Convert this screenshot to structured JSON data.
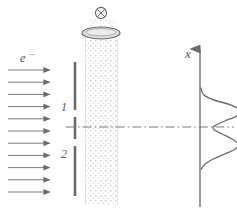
{
  "figure": {
    "background_color": "#ffffff",
    "ink_color": "#6b6b6b",
    "dark_ink_color": "#555555",
    "stipple_color": "#cfcfcf",
    "lens_fill_color": "#dcdcdc",
    "width": 237,
    "height": 213
  },
  "labels": {
    "electron_beam": "e",
    "electron_charge_superscript": "–",
    "slit_top": "1",
    "slit_bottom": "2",
    "axis_x": "x"
  },
  "source": {
    "symbol_name": "circle-cross-into-page",
    "symbol_glyph": "⊗",
    "center_x": 101,
    "center_y": 13,
    "radius": 6
  },
  "lens": {
    "name": "condenser-lens-ellipse",
    "center_x": 101,
    "center_y": 33,
    "rx": 19,
    "ry": 6,
    "fill": "#dcdcdc"
  },
  "beam": {
    "name": "stippled-photon-beam",
    "left_x": 85,
    "right_x": 118,
    "top_y": 39,
    "bottom_y": 205,
    "dot_color": "#cfcfcf"
  },
  "electron_arrows": {
    "count": 11,
    "start_x": 8,
    "end_x": 50,
    "first_y": 70,
    "spacing": 12.2,
    "label_x": 20,
    "label_y": 62
  },
  "barrier": {
    "name": "double-slit-barrier",
    "x": 75,
    "segments": [
      {
        "name": "upper-plate",
        "y_top": 62,
        "y_bottom": 110
      },
      {
        "name": "center-plate",
        "y_top": 117,
        "y_bottom": 139
      },
      {
        "name": "lower-plate",
        "y_top": 146,
        "y_bottom": 196
      }
    ],
    "slit_labels": [
      {
        "text": "1",
        "x": 64,
        "y": 110
      },
      {
        "text": "2",
        "x": 64,
        "y": 156
      }
    ]
  },
  "optical_axis": {
    "name": "dash-dot-optical-axis",
    "y": 127,
    "x_start": 76,
    "x_end": 234,
    "style": "dash-dot"
  },
  "detector_axis": {
    "name": "x-axis-vertical",
    "x": 200,
    "y_top": 40,
    "y_bottom": 207,
    "arrow_tip_y": 38,
    "label": "x",
    "label_x": 188,
    "label_y": 54
  },
  "chart_data": {
    "type": "line",
    "orientation": "vertical",
    "xlabel": "intensity",
    "ylabel": "x",
    "grid": false,
    "legend": null,
    "axis_x_pixel": 200,
    "center_y": 127,
    "points": [
      {
        "x_position": 88,
        "intensity": 0.02
      },
      {
        "x_position": 95,
        "intensity": 0.1
      },
      {
        "x_position": 100,
        "intensity": 0.35
      },
      {
        "x_position": 104,
        "intensity": 0.7
      },
      {
        "x_position": 108,
        "intensity": 0.93
      },
      {
        "x_position": 112,
        "intensity": 1.0
      },
      {
        "x_position": 116,
        "intensity": 0.92
      },
      {
        "x_position": 121,
        "intensity": 0.62
      },
      {
        "x_position": 125,
        "intensity": 0.4
      },
      {
        "x_position": 127,
        "intensity": 0.33
      },
      {
        "x_position": 130,
        "intensity": 0.36
      },
      {
        "x_position": 134,
        "intensity": 0.55
      },
      {
        "x_position": 139,
        "intensity": 0.8
      },
      {
        "x_position": 144,
        "intensity": 0.95
      },
      {
        "x_position": 149,
        "intensity": 0.88
      },
      {
        "x_position": 154,
        "intensity": 0.62
      },
      {
        "x_position": 159,
        "intensity": 0.33
      },
      {
        "x_position": 164,
        "intensity": 0.13
      },
      {
        "x_position": 169,
        "intensity": 0.03
      }
    ],
    "maxima": [
      {
        "x_position": 112,
        "intensity": 1.0,
        "label": "first maximum"
      },
      {
        "x_position": 144,
        "intensity": 0.95,
        "label": "second maximum"
      }
    ],
    "minima": [
      {
        "x_position": 127,
        "intensity": 0.33,
        "label": "central minimum"
      }
    ]
  }
}
